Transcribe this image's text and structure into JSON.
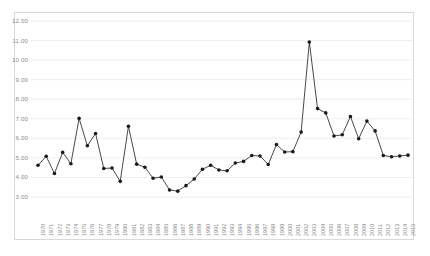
{
  "chart_data": {
    "type": "line",
    "title": "",
    "xlabel": "",
    "ylabel": "",
    "ylim": [
      3.0,
      12.0
    ],
    "ytick_values": [
      3.0,
      4.0,
      5.0,
      6.0,
      7.0,
      8.0,
      9.0,
      10.0,
      11.0,
      12.0
    ],
    "ytick_labels": [
      "3.00",
      "4.00",
      "5.00",
      "6.00",
      "7.00",
      "8.00",
      "9.00",
      "10.00",
      "11.00",
      "12.00"
    ],
    "grid": true,
    "legend": false,
    "marker": "filled-circle",
    "series_color": "#1a1a1a",
    "grid_color": "#e8e8e8",
    "border_color": "#d9d9d9",
    "axis_text_color": "#8c8c8c",
    "categories": [
      "1970",
      "1971",
      "1972",
      "1973",
      "1974",
      "1975",
      "1976",
      "1977",
      "1978",
      "1979",
      "1980",
      "1981",
      "1982",
      "1983",
      "1984",
      "1985",
      "1986",
      "1987",
      "1988",
      "1989",
      "1990",
      "1991",
      "1992",
      "1993",
      "1994",
      "1995",
      "1996",
      "1997",
      "1998",
      "1999",
      "2000",
      "2001",
      "2002",
      "2003",
      "2004",
      "2005",
      "2006",
      "2007",
      "2008",
      "2009",
      "2010",
      "2011",
      "2012",
      "2013",
      "2014",
      "2015"
    ],
    "values": [
      4.62,
      5.08,
      4.2,
      5.28,
      4.7,
      7.02,
      5.62,
      6.25,
      4.46,
      4.48,
      3.8,
      6.62,
      4.68,
      4.52,
      3.96,
      4.02,
      3.36,
      3.3,
      3.58,
      3.92,
      4.42,
      4.62,
      4.38,
      4.34,
      4.74,
      4.82,
      5.12,
      5.1,
      4.66,
      5.68,
      5.3,
      5.32,
      6.32,
      10.92,
      7.52,
      7.3,
      6.12,
      6.18,
      7.12,
      5.98,
      6.88,
      6.38,
      5.12,
      5.06,
      5.1,
      5.14
    ]
  }
}
